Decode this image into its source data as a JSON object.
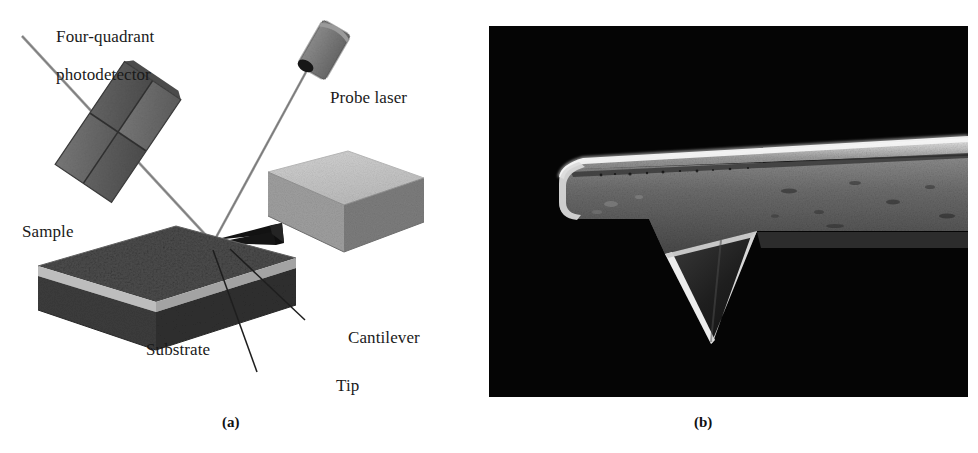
{
  "figure": {
    "background_color": "#ffffff"
  },
  "panels": [
    {
      "id": "a",
      "caption": "(a)",
      "type": "schematic-diagram",
      "description": "Schematic of an atomic force microscope: a probe laser beam reflects off the back of a cantilever onto a four-quadrant photodetector while the tip scans a sample on a substrate."
    },
    {
      "id": "b",
      "caption": "(b)",
      "type": "sem-micrograph",
      "description": "Scanning electron micrograph of the AFM cantilever beam with its downward-pointing pyramidal tip, imaged against a black background."
    }
  ],
  "panel_a": {
    "labels": [
      {
        "id": "photodetector",
        "line1": "Four-quadrant",
        "line2": "photodetector"
      },
      {
        "id": "probe_laser",
        "text": "Probe laser"
      },
      {
        "id": "sample",
        "text": "Sample"
      },
      {
        "id": "substrate",
        "text": "Substrate"
      },
      {
        "id": "cantilever",
        "text": "Cantilever"
      },
      {
        "id": "tip",
        "text": "Tip"
      }
    ],
    "components": {
      "photodetector_name": "four-quadrant-photodetector",
      "probe_laser_name": "probe-laser-module",
      "cantilever_holder_name": "cantilever-holder-block",
      "cantilever_name": "v-shaped-cantilever",
      "tip_name": "afm-tip",
      "sample_name": "sample-layer",
      "substrate_name": "substrate-layer",
      "incident_beam_name": "incident-laser-beam",
      "reflected_beam_name": "reflected-laser-beam"
    },
    "colors": {
      "detector_face_light": "#6f6f6f",
      "detector_face_dark": "#555555",
      "laser_body": "#838383",
      "laser_body_dark": "#6a6a6a",
      "laser_aperture": "#1c1c1c",
      "holder_top": "#c9c9c9",
      "holder_front": "#9d9d9d",
      "holder_side": "#7b7b7b",
      "sample_top": "#4a4a4a",
      "sample_band": "#b9b9b9",
      "sample_base": "#3a3a3a",
      "cantilever": "#141414",
      "beam": "#8a8a8a",
      "leader_line": "#232323",
      "text": "#1a1a1a"
    }
  },
  "panel_b": {
    "background_color": "#050505",
    "features": [
      {
        "name": "cantilever-beam",
        "description": "Long tapered beam entering from the right edge, rounded at its free left end"
      },
      {
        "name": "cantilever-top-edge-highlight",
        "description": "Bright specular line along the upper edge of the beam"
      },
      {
        "name": "pyramidal-tip",
        "description": "Downward-pointing triangular pyramid tip with bright edges and dark interior"
      },
      {
        "name": "beam-surface-texture",
        "description": "Mottled gray surface with small bright specks and pits"
      }
    ],
    "colors": {
      "background": "#050505",
      "beam_body": "#6a6a6a",
      "beam_body_dark": "#4c4c4c",
      "edge_highlight": "#f0f0f0",
      "tip_interior": "#1b1b1b",
      "tip_edge": "#e8e8e8"
    }
  }
}
